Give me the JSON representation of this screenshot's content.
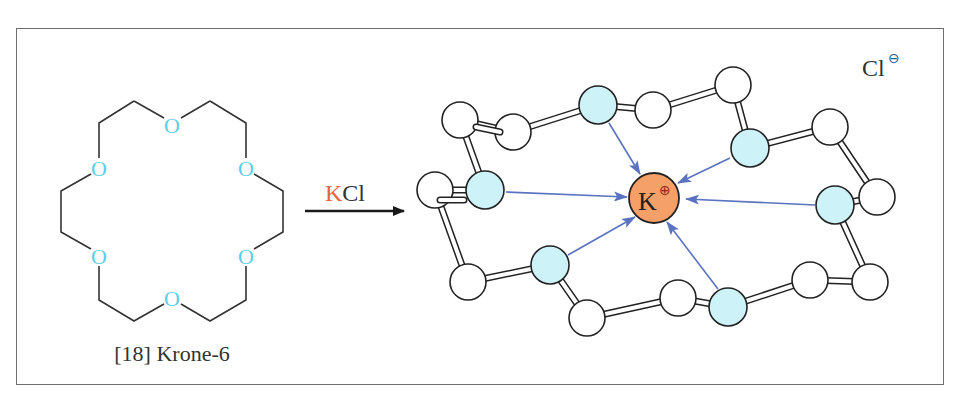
{
  "diagram": {
    "crown_ether": {
      "label": "[18] Krone-6",
      "oxygen_label": "O",
      "oxygen_color": "#5ccfe6",
      "bond_color": "#333333"
    },
    "reaction": {
      "reagent_K": "K",
      "reagent_rest": "Cl",
      "reagent_K_color": "#e8643c",
      "arrow_color": "#1a1a1a"
    },
    "complex": {
      "cation_label": "K",
      "cation_charge": "⊕",
      "cation_color": "#f5a068",
      "anion_label": "Cl",
      "anion_charge": "⊖",
      "anion_charge_color": "#2a5a8a",
      "oxygen_atom_color": "#cdf2f7",
      "carbon_atom_color": "#ffffff",
      "coordination_arrow_color": "#5a73c0",
      "oxygen_count": 6,
      "carbon_count": 12
    }
  }
}
